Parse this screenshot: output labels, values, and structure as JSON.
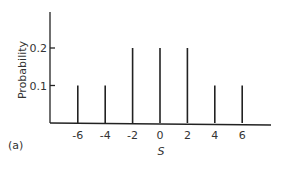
{
  "panel_label": "(a)",
  "chart_data": {
    "type": "bar",
    "style": "stem",
    "title": "",
    "xlabel": "S",
    "ylabel": "Probability",
    "categories": [
      "-6",
      "-4",
      "-2",
      "0",
      "2",
      "4",
      "6"
    ],
    "x": [
      -6,
      -4,
      -2,
      0,
      2,
      4,
      6
    ],
    "values": [
      0.1,
      0.1,
      0.2,
      0.2,
      0.2,
      0.1,
      0.1
    ],
    "yticks": [
      "0.1",
      "0.2"
    ],
    "ylim": [
      0,
      0.3
    ],
    "grid": false,
    "legend": null
  }
}
